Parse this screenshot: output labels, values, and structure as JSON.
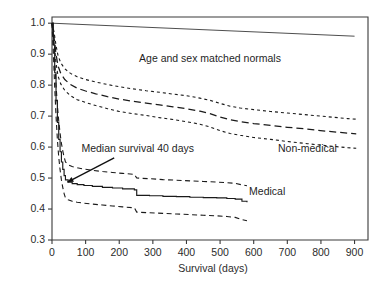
{
  "chart_data": {
    "type": "line",
    "title": "",
    "xlabel": "Survival (days)",
    "ylabel": "",
    "xlim": [
      0,
      940
    ],
    "ylim": [
      0.3,
      1.02
    ],
    "grid": false,
    "legend_position": "inline-annotations",
    "x_ticks": [
      0,
      100,
      200,
      300,
      400,
      500,
      600,
      700,
      800,
      900
    ],
    "x_tick_labels": [
      "0",
      "100",
      "200",
      "300",
      "400",
      "500",
      "600",
      "700",
      "800",
      "900"
    ],
    "y_ticks": [
      0.3,
      0.4,
      0.5,
      0.6,
      0.7,
      0.8,
      0.9,
      1.0
    ],
    "y_tick_labels": [
      "0.3",
      "0.4",
      "0.5",
      "0.6",
      "0.7",
      "0.8",
      "0.9",
      "1.0"
    ],
    "annotations": [
      {
        "name": "normals-label",
        "text": "Age and sex matched normals",
        "x": 470,
        "y": 0.875
      },
      {
        "name": "nonmedical-label",
        "text": "Non-medical",
        "x": 760,
        "y": 0.585
      },
      {
        "name": "medical-label",
        "text": "Medical",
        "x": 640,
        "y": 0.445
      },
      {
        "name": "median-survival-label",
        "text": "Median survival 40 days",
        "x": 255,
        "y": 0.585
      }
    ],
    "arrow": {
      "name": "median-survival-arrow",
      "from_x": 185,
      "from_y": 0.565,
      "to_x": 46,
      "to_y": 0.487
    },
    "series": [
      {
        "name": "Age and sex matched normals",
        "style": "solid-thin",
        "points": [
          [
            0,
            1.0
          ],
          [
            900,
            0.958
          ]
        ]
      },
      {
        "name": "Non-medical",
        "style": "dashed",
        "points": [
          [
            0,
            1.0
          ],
          [
            6,
            0.955
          ],
          [
            12,
            0.9
          ],
          [
            18,
            0.862
          ],
          [
            26,
            0.838
          ],
          [
            38,
            0.818
          ],
          [
            55,
            0.802
          ],
          [
            75,
            0.79
          ],
          [
            100,
            0.781
          ],
          [
            130,
            0.772
          ],
          [
            165,
            0.763
          ],
          [
            200,
            0.755
          ],
          [
            240,
            0.748
          ],
          [
            280,
            0.742
          ],
          [
            320,
            0.736
          ],
          [
            360,
            0.73
          ],
          [
            400,
            0.724
          ],
          [
            440,
            0.716
          ],
          [
            470,
            0.708
          ],
          [
            500,
            0.697
          ],
          [
            530,
            0.688
          ],
          [
            560,
            0.682
          ],
          [
            600,
            0.676
          ],
          [
            650,
            0.67
          ],
          [
            700,
            0.664
          ],
          [
            760,
            0.658
          ],
          [
            820,
            0.651
          ],
          [
            880,
            0.645
          ],
          [
            905,
            0.643
          ]
        ]
      },
      {
        "name": "Non-medical upper 95% CI",
        "style": "dotted",
        "points": [
          [
            0,
            1.0
          ],
          [
            6,
            0.972
          ],
          [
            12,
            0.928
          ],
          [
            18,
            0.895
          ],
          [
            26,
            0.872
          ],
          [
            38,
            0.853
          ],
          [
            55,
            0.838
          ],
          [
            75,
            0.827
          ],
          [
            100,
            0.818
          ],
          [
            130,
            0.81
          ],
          [
            165,
            0.802
          ],
          [
            200,
            0.795
          ],
          [
            240,
            0.788
          ],
          [
            280,
            0.782
          ],
          [
            320,
            0.777
          ],
          [
            360,
            0.771
          ],
          [
            400,
            0.766
          ],
          [
            440,
            0.758
          ],
          [
            470,
            0.751
          ],
          [
            500,
            0.741
          ],
          [
            530,
            0.732
          ],
          [
            560,
            0.726
          ],
          [
            600,
            0.721
          ],
          [
            650,
            0.715
          ],
          [
            700,
            0.71
          ],
          [
            760,
            0.704
          ],
          [
            820,
            0.698
          ],
          [
            880,
            0.692
          ],
          [
            905,
            0.69
          ]
        ]
      },
      {
        "name": "Non-medical lower 95% CI",
        "style": "dotted",
        "points": [
          [
            0,
            1.0
          ],
          [
            6,
            0.938
          ],
          [
            12,
            0.872
          ],
          [
            18,
            0.829
          ],
          [
            26,
            0.804
          ],
          [
            38,
            0.783
          ],
          [
            55,
            0.766
          ],
          [
            75,
            0.753
          ],
          [
            100,
            0.744
          ],
          [
            130,
            0.734
          ],
          [
            165,
            0.724
          ],
          [
            200,
            0.715
          ],
          [
            240,
            0.708
          ],
          [
            280,
            0.702
          ],
          [
            320,
            0.695
          ],
          [
            360,
            0.689
          ],
          [
            400,
            0.682
          ],
          [
            440,
            0.674
          ],
          [
            470,
            0.665
          ],
          [
            500,
            0.653
          ],
          [
            530,
            0.644
          ],
          [
            560,
            0.638
          ],
          [
            600,
            0.631
          ],
          [
            650,
            0.625
          ],
          [
            700,
            0.618
          ],
          [
            760,
            0.611
          ],
          [
            820,
            0.604
          ],
          [
            880,
            0.598
          ],
          [
            905,
            0.596
          ]
        ]
      },
      {
        "name": "Medical",
        "style": "solid-step",
        "points": [
          [
            0,
            1.0
          ],
          [
            4,
            0.93
          ],
          [
            8,
            0.84
          ],
          [
            12,
            0.75
          ],
          [
            16,
            0.68
          ],
          [
            20,
            0.625
          ],
          [
            24,
            0.585
          ],
          [
            28,
            0.552
          ],
          [
            32,
            0.528
          ],
          [
            36,
            0.508
          ],
          [
            40,
            0.494
          ],
          [
            48,
            0.487
          ],
          [
            60,
            0.482
          ],
          [
            75,
            0.479
          ],
          [
            95,
            0.476
          ],
          [
            120,
            0.473
          ],
          [
            150,
            0.47
          ],
          [
            180,
            0.468
          ],
          [
            210,
            0.465
          ],
          [
            245,
            0.462
          ],
          [
            252,
            0.444
          ],
          [
            290,
            0.443
          ],
          [
            330,
            0.441
          ],
          [
            370,
            0.44
          ],
          [
            410,
            0.438
          ],
          [
            450,
            0.437
          ],
          [
            490,
            0.436
          ],
          [
            520,
            0.434
          ],
          [
            545,
            0.432
          ],
          [
            565,
            0.425
          ],
          [
            580,
            0.422
          ]
        ]
      },
      {
        "name": "Medical upper 95% CI",
        "style": "dashed-ci",
        "points": [
          [
            0,
            1.0
          ],
          [
            4,
            0.955
          ],
          [
            8,
            0.885
          ],
          [
            12,
            0.8
          ],
          [
            16,
            0.735
          ],
          [
            20,
            0.685
          ],
          [
            24,
            0.645
          ],
          [
            28,
            0.612
          ],
          [
            32,
            0.588
          ],
          [
            36,
            0.568
          ],
          [
            40,
            0.552
          ],
          [
            48,
            0.543
          ],
          [
            60,
            0.537
          ],
          [
            75,
            0.533
          ],
          [
            95,
            0.529
          ],
          [
            120,
            0.525
          ],
          [
            150,
            0.521
          ],
          [
            180,
            0.518
          ],
          [
            210,
            0.515
          ],
          [
            245,
            0.512
          ],
          [
            252,
            0.5
          ],
          [
            290,
            0.498
          ],
          [
            330,
            0.495
          ],
          [
            370,
            0.493
          ],
          [
            410,
            0.491
          ],
          [
            450,
            0.489
          ],
          [
            490,
            0.487
          ],
          [
            520,
            0.485
          ],
          [
            545,
            0.483
          ],
          [
            565,
            0.478
          ],
          [
            580,
            0.475
          ]
        ]
      },
      {
        "name": "Medical lower 95% CI",
        "style": "dashed-ci",
        "points": [
          [
            0,
            1.0
          ],
          [
            4,
            0.905
          ],
          [
            8,
            0.795
          ],
          [
            12,
            0.7
          ],
          [
            16,
            0.625
          ],
          [
            20,
            0.568
          ],
          [
            24,
            0.527
          ],
          [
            28,
            0.494
          ],
          [
            32,
            0.47
          ],
          [
            36,
            0.45
          ],
          [
            40,
            0.436
          ],
          [
            48,
            0.43
          ],
          [
            60,
            0.425
          ],
          [
            75,
            0.422
          ],
          [
            95,
            0.419
          ],
          [
            120,
            0.416
          ],
          [
            150,
            0.413
          ],
          [
            180,
            0.41
          ],
          [
            210,
            0.407
          ],
          [
            245,
            0.404
          ],
          [
            252,
            0.39
          ],
          [
            290,
            0.388
          ],
          [
            330,
            0.386
          ],
          [
            370,
            0.384
          ],
          [
            410,
            0.382
          ],
          [
            450,
            0.38
          ],
          [
            490,
            0.378
          ],
          [
            520,
            0.376
          ],
          [
            545,
            0.373
          ],
          [
            565,
            0.366
          ],
          [
            580,
            0.362
          ]
        ]
      }
    ]
  }
}
